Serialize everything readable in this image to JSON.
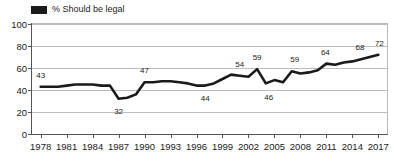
{
  "legend": {
    "swatch_color": "#1a1a1a",
    "label": "% Should be legal"
  },
  "chart_data": {
    "type": "line",
    "title": "",
    "xlabel": "",
    "ylabel": "",
    "ylim": [
      0,
      100
    ],
    "xlim": [
      1977,
      2018
    ],
    "grid": true,
    "legend_position": "top-left",
    "ytick_labels": [
      "100",
      "80",
      "60",
      "40",
      "20",
      "0"
    ],
    "ytick_values": [
      100,
      80,
      60,
      40,
      20,
      0
    ],
    "xtick_labels": [
      "1978",
      "1981",
      "1984",
      "1987",
      "1990",
      "1993",
      "1996",
      "1999",
      "2002",
      "2005",
      "2008",
      "2011",
      "2014",
      "2017"
    ],
    "xtick_values": [
      1978,
      1981,
      1984,
      1987,
      1990,
      1993,
      1996,
      1999,
      2002,
      2005,
      2008,
      2011,
      2014,
      2017
    ],
    "series": [
      {
        "name": "% Should be legal",
        "color": "#1a1a1a",
        "x": [
          1978,
          1979,
          1980,
          1981,
          1982,
          1983,
          1984,
          1985,
          1986,
          1987,
          1988,
          1989,
          1990,
          1991,
          1992,
          1993,
          1994,
          1995,
          1996,
          1997,
          1998,
          1999,
          2000,
          2001,
          2002,
          2003,
          2004,
          2005,
          2006,
          2007,
          2008,
          2009,
          2010,
          2011,
          2012,
          2013,
          2014,
          2015,
          2016,
          2017
        ],
        "values": [
          43,
          43,
          43,
          44,
          45,
          45,
          45,
          44,
          44,
          32,
          33,
          36,
          47,
          47,
          48,
          48,
          47,
          46,
          44,
          44,
          46,
          50,
          54,
          53,
          52,
          59,
          46,
          49,
          47,
          57,
          55,
          56,
          58,
          64,
          63,
          65,
          66,
          68,
          70,
          72
        ]
      }
    ],
    "point_labels": [
      {
        "x": 1978,
        "y": 43,
        "text": "43",
        "dx": 0,
        "dy": -12
      },
      {
        "x": 1987,
        "y": 32,
        "text": "32",
        "dx": 0,
        "dy": 12
      },
      {
        "x": 1990,
        "y": 47,
        "text": "47",
        "dx": 0,
        "dy": -12
      },
      {
        "x": 1997,
        "y": 44,
        "text": "44",
        "dx": 0,
        "dy": 12
      },
      {
        "x": 2001,
        "y": 53,
        "text": "54",
        "dx": 0,
        "dy": -12
      },
      {
        "x": 2003,
        "y": 59,
        "text": "59",
        "dx": 0,
        "dy": -12
      },
      {
        "x": 2004,
        "y": 46,
        "text": "46",
        "dx": 3,
        "dy": 14
      },
      {
        "x": 2007,
        "y": 57,
        "text": "59",
        "dx": 3,
        "dy": -12
      },
      {
        "x": 2011,
        "y": 64,
        "text": "64",
        "dx": -1,
        "dy": -12
      },
      {
        "x": 2015,
        "y": 68,
        "text": "68",
        "dx": -1,
        "dy": -12
      },
      {
        "x": 2017,
        "y": 72,
        "text": "72",
        "dx": 1,
        "dy": -12
      }
    ]
  }
}
